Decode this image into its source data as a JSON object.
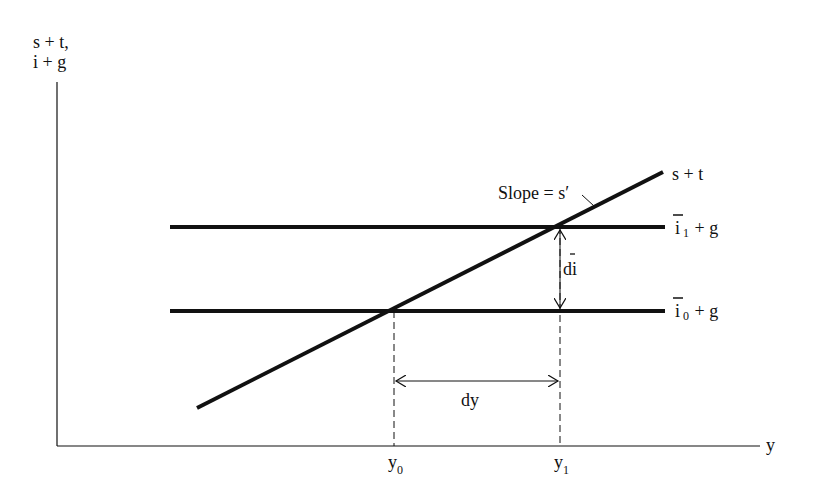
{
  "diagram": {
    "y_axis_label_line1": "s + t,",
    "y_axis_label_line2": "i + g",
    "x_axis_label": "y",
    "curve_label": "s + t",
    "slope_label": "Slope = s′",
    "upper_line_label_base": "i",
    "upper_line_label_sub": "1",
    "upper_line_label_rest": " + g",
    "lower_line_label_base": "i",
    "lower_line_label_sub": "0",
    "lower_line_label_rest": " + g",
    "vertical_gap_label": "di",
    "horizontal_gap_label": "dy",
    "x_tick_0_base": "y",
    "x_tick_0_sub": "0",
    "x_tick_1_base": "y",
    "x_tick_1_sub": "1"
  },
  "colors": {
    "ink": "#111111",
    "background": "#ffffff"
  }
}
